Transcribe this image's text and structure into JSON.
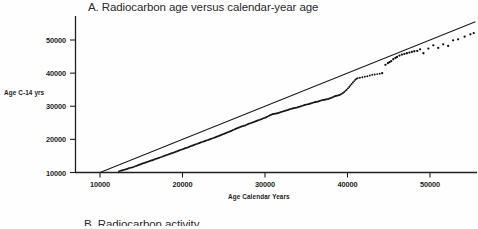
{
  "figure": {
    "panel_label": "A.",
    "panel_title": "A. Radiocarbon age versus calendar-year age",
    "next_panel_title": "B. Radiocarbon activity",
    "background_color": "#fefefe",
    "foreground_color": "#231f20"
  },
  "axes": {
    "y_title": "Age C-14 yrs",
    "x_title": "Age Calendar Years",
    "y_ticks": [
      "10000",
      "20000",
      "30000",
      "40000",
      "50000"
    ],
    "x_ticks": [
      "10000",
      "20000",
      "30000",
      "40000",
      "50000"
    ]
  },
  "chart_data": {
    "type": "scatter",
    "title": "A. Radiocarbon age versus calendar-year age",
    "xlabel": "Age Calendar Years",
    "ylabel": "Age C-14 yrs",
    "xlim": [
      9000,
      56000
    ],
    "ylim": [
      8500,
      55000
    ],
    "xticks": [
      10000,
      20000,
      30000,
      40000,
      50000
    ],
    "yticks": [
      10000,
      20000,
      30000,
      40000,
      50000
    ],
    "grid": false,
    "legend": null,
    "series": [
      {
        "name": "1:1 line (calendar age = radiocarbon age)",
        "type": "line",
        "color": "#1a1a1a",
        "x": [
          10000,
          55500
        ],
        "y": [
          10000,
          55500
        ]
      },
      {
        "name": "Calibration data (radiocarbon age vs calendar age)",
        "type": "scatter",
        "color": "#111111",
        "marker": "dot",
        "points": [
          [
            12300,
            10350
          ],
          [
            12450,
            10500
          ],
          [
            12600,
            10620
          ],
          [
            12750,
            10700
          ],
          [
            12900,
            10800
          ],
          [
            13050,
            10900
          ],
          [
            13200,
            11020
          ],
          [
            13350,
            11150
          ],
          [
            13500,
            11280
          ],
          [
            13650,
            11400
          ],
          [
            13800,
            11480
          ],
          [
            13950,
            11560
          ],
          [
            14100,
            11700
          ],
          [
            14250,
            11850
          ],
          [
            14400,
            12000
          ],
          [
            14550,
            12150
          ],
          [
            14700,
            12280
          ],
          [
            14850,
            12420
          ],
          [
            15000,
            12560
          ],
          [
            15150,
            12700
          ],
          [
            15300,
            12830
          ],
          [
            15450,
            12950
          ],
          [
            15600,
            13080
          ],
          [
            15750,
            13200
          ],
          [
            15900,
            13350
          ],
          [
            16050,
            13480
          ],
          [
            16200,
            13600
          ],
          [
            16350,
            13720
          ],
          [
            16500,
            13860
          ],
          [
            16650,
            14000
          ],
          [
            16800,
            14140
          ],
          [
            16950,
            14260
          ],
          [
            17100,
            14380
          ],
          [
            17250,
            14500
          ],
          [
            17400,
            14650
          ],
          [
            17550,
            14800
          ],
          [
            17700,
            14950
          ],
          [
            17850,
            15080
          ],
          [
            18000,
            15200
          ],
          [
            18150,
            15330
          ],
          [
            18300,
            15470
          ],
          [
            18450,
            15600
          ],
          [
            18600,
            15740
          ],
          [
            18750,
            15880
          ],
          [
            18900,
            16000
          ],
          [
            19050,
            16130
          ],
          [
            19200,
            16280
          ],
          [
            19350,
            16420
          ],
          [
            19500,
            16560
          ],
          [
            19650,
            16700
          ],
          [
            19800,
            16840
          ],
          [
            19950,
            16980
          ],
          [
            20100,
            17120
          ],
          [
            20250,
            17250
          ],
          [
            20400,
            17380
          ],
          [
            20550,
            17500
          ],
          [
            20700,
            17650
          ],
          [
            20850,
            17800
          ],
          [
            21000,
            17950
          ],
          [
            21150,
            18080
          ],
          [
            21300,
            18220
          ],
          [
            21450,
            18360
          ],
          [
            21600,
            18500
          ],
          [
            21750,
            18640
          ],
          [
            21900,
            18780
          ],
          [
            22050,
            18900
          ],
          [
            22200,
            19040
          ],
          [
            22350,
            19180
          ],
          [
            22500,
            19320
          ],
          [
            22650,
            19450
          ],
          [
            22800,
            19580
          ],
          [
            22950,
            19700
          ],
          [
            23100,
            19820
          ],
          [
            23250,
            19960
          ],
          [
            23400,
            20100
          ],
          [
            23550,
            20240
          ],
          [
            23700,
            20380
          ],
          [
            23850,
            20520
          ],
          [
            24000,
            20660
          ],
          [
            24150,
            20800
          ],
          [
            24300,
            20950
          ],
          [
            24450,
            21100
          ],
          [
            24600,
            21250
          ],
          [
            24750,
            21400
          ],
          [
            24900,
            21550
          ],
          [
            25050,
            21700
          ],
          [
            25200,
            21850
          ],
          [
            25350,
            22000
          ],
          [
            25500,
            22150
          ],
          [
            25650,
            22300
          ],
          [
            25800,
            22450
          ],
          [
            25950,
            22600
          ],
          [
            26100,
            22780
          ],
          [
            26250,
            22950
          ],
          [
            26400,
            23120
          ],
          [
            26550,
            23280
          ],
          [
            26700,
            23440
          ],
          [
            26850,
            23600
          ],
          [
            27000,
            23760
          ],
          [
            27150,
            23900
          ],
          [
            27300,
            24000
          ],
          [
            27450,
            24100
          ],
          [
            27600,
            24220
          ],
          [
            27750,
            24380
          ],
          [
            27900,
            24550
          ],
          [
            28050,
            24700
          ],
          [
            28200,
            24840
          ],
          [
            28350,
            24980
          ],
          [
            28500,
            25120
          ],
          [
            28650,
            25260
          ],
          [
            28800,
            25400
          ],
          [
            28950,
            25540
          ],
          [
            29100,
            25680
          ],
          [
            29250,
            25820
          ],
          [
            29400,
            25960
          ],
          [
            29550,
            26100
          ],
          [
            29700,
            26250
          ],
          [
            29850,
            26400
          ],
          [
            30000,
            26550
          ],
          [
            30150,
            26700
          ],
          [
            30300,
            26880
          ],
          [
            30450,
            27080
          ],
          [
            30600,
            27280
          ],
          [
            30750,
            27450
          ],
          [
            30900,
            27580
          ],
          [
            31050,
            27680
          ],
          [
            31200,
            27750
          ],
          [
            31350,
            27820
          ],
          [
            31500,
            27900
          ],
          [
            31650,
            28000
          ],
          [
            31800,
            28120
          ],
          [
            31950,
            28250
          ],
          [
            32100,
            28380
          ],
          [
            32250,
            28500
          ],
          [
            32400,
            28600
          ],
          [
            32550,
            28700
          ],
          [
            32700,
            28820
          ],
          [
            32850,
            28950
          ],
          [
            33000,
            29080
          ],
          [
            33150,
            29200
          ],
          [
            33300,
            29320
          ],
          [
            33450,
            29400
          ],
          [
            33600,
            29480
          ],
          [
            33750,
            29560
          ],
          [
            33900,
            29650
          ],
          [
            34050,
            29760
          ],
          [
            34200,
            29880
          ],
          [
            34350,
            30000
          ],
          [
            34500,
            30120
          ],
          [
            34650,
            30250
          ],
          [
            34800,
            30380
          ],
          [
            34950,
            30480
          ],
          [
            35100,
            30560
          ],
          [
            35250,
            30640
          ],
          [
            35400,
            30740
          ],
          [
            35550,
            30850
          ],
          [
            35700,
            30980
          ],
          [
            35850,
            31100
          ],
          [
            36000,
            31200
          ],
          [
            36150,
            31280
          ],
          [
            36300,
            31350
          ],
          [
            36450,
            31450
          ],
          [
            36600,
            31580
          ],
          [
            36750,
            31700
          ],
          [
            36900,
            31800
          ],
          [
            37050,
            31880
          ],
          [
            37200,
            31950
          ],
          [
            37350,
            32020
          ],
          [
            37500,
            32100
          ],
          [
            37650,
            32200
          ],
          [
            37800,
            32320
          ],
          [
            37950,
            32450
          ],
          [
            38100,
            32600
          ],
          [
            38250,
            32780
          ],
          [
            38400,
            32950
          ],
          [
            38550,
            33080
          ],
          [
            38700,
            33180
          ],
          [
            38850,
            33280
          ],
          [
            39000,
            33400
          ],
          [
            39150,
            33550
          ],
          [
            39300,
            33750
          ],
          [
            39450,
            34000
          ],
          [
            39600,
            34300
          ],
          [
            39750,
            34650
          ],
          [
            39900,
            35000
          ],
          [
            40050,
            35400
          ],
          [
            40200,
            35800
          ],
          [
            40350,
            36250
          ],
          [
            40500,
            36700
          ],
          [
            40650,
            37150
          ],
          [
            40800,
            37600
          ],
          [
            40950,
            38000
          ],
          [
            41100,
            38300
          ],
          [
            41250,
            38500
          ],
          [
            41500,
            38600
          ],
          [
            41800,
            38750
          ],
          [
            42100,
            38900
          ],
          [
            42400,
            39050
          ],
          [
            42700,
            39300
          ],
          [
            43000,
            39500
          ],
          [
            43300,
            39600
          ],
          [
            43600,
            39700
          ],
          [
            43900,
            39800
          ],
          [
            44200,
            40000
          ],
          [
            44600,
            42500
          ],
          [
            44900,
            43000
          ],
          [
            45100,
            43300
          ],
          [
            45300,
            43600
          ],
          [
            45550,
            44200
          ],
          [
            45800,
            44600
          ],
          [
            46000,
            44900
          ],
          [
            46300,
            45300
          ],
          [
            46600,
            45600
          ],
          [
            46900,
            45800
          ],
          [
            47200,
            46000
          ],
          [
            47500,
            46200
          ],
          [
            47800,
            46400
          ],
          [
            48100,
            46600
          ],
          [
            48450,
            46700
          ],
          [
            48800,
            47200
          ],
          [
            49200,
            46000
          ],
          [
            49800,
            47400
          ],
          [
            50400,
            48400
          ],
          [
            51000,
            47600
          ],
          [
            51600,
            48700
          ],
          [
            52200,
            48200
          ],
          [
            52800,
            49900
          ],
          [
            53400,
            50200
          ],
          [
            54200,
            51000
          ],
          [
            54900,
            51700
          ],
          [
            55300,
            52100
          ]
        ]
      }
    ]
  }
}
